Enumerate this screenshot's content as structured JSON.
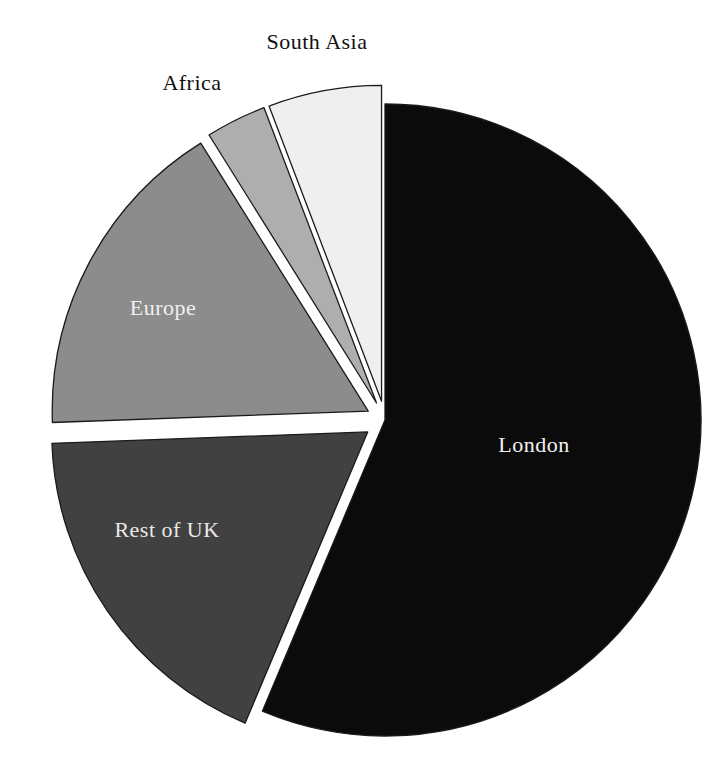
{
  "figure": {
    "background": "#ffffff",
    "outline_color": "#1a1a1a"
  },
  "chart_data": {
    "type": "pie",
    "title": "",
    "legend": "none",
    "start_angle_deg_clockwise_from_top": 0,
    "values_note": "percent shares estimated from slice angles; no numeric labels are printed in the figure",
    "categories": [
      "London",
      "Rest of UK",
      "Europe",
      "Africa",
      "South Asia"
    ],
    "values": [
      56.4,
      18.1,
      16.7,
      3.1,
      5.8
    ],
    "slices": [
      {
        "id": "london",
        "label": "London",
        "value": 56.4,
        "color": "#0b0b0b",
        "explode": 0,
        "label_color": "#f2f2f2",
        "label_x": 534,
        "label_y": 452,
        "label_inside": true
      },
      {
        "id": "rest-of-uk",
        "label": "Rest of UK",
        "value": 18.1,
        "color": "#414141",
        "explode": 21,
        "label_color": "#e9e9e9",
        "label_x": 167,
        "label_y": 537,
        "label_inside": true
      },
      {
        "id": "europe",
        "label": "Europe",
        "value": 16.7,
        "color": "#8c8c8c",
        "explode": 19,
        "label_color": "#f0f0f0",
        "label_x": 163,
        "label_y": 315,
        "label_inside": true
      },
      {
        "id": "africa",
        "label": "Africa",
        "value": 3.1,
        "color": "#aeaeae",
        "explode": 19,
        "label_color": "#111111",
        "label_x": 192,
        "label_y": 90,
        "label_inside": false
      },
      {
        "id": "south-asia",
        "label": "South Asia",
        "value": 5.8,
        "color": "#efefef",
        "explode": 19,
        "label_color": "#111111",
        "label_x": 317,
        "label_y": 49,
        "label_inside": false
      }
    ],
    "geometry": {
      "cx": 385,
      "cy": 420,
      "r": 316,
      "stroke": "#1a1a1a",
      "stroke_width": 1.3
    }
  }
}
